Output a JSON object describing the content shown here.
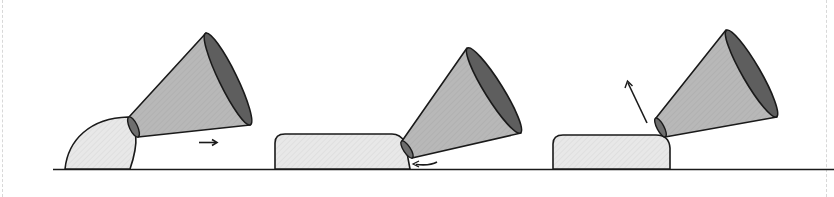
{
  "diagram": {
    "colors": {
      "stroke": "#1a1a1a",
      "cone_body": "#b4b4b4",
      "cone_mouth": "#5e5e5e",
      "cone_throat": "#6e6e6e",
      "shape_fill": "#e6e6e6",
      "background": "#ffffff",
      "border": "#d8d8d8"
    },
    "panels": [
      {
        "id": "panel-1",
        "shape": "quarter-dome",
        "arrow": {
          "direction": "right",
          "glyph": "→"
        }
      },
      {
        "id": "panel-2",
        "shape": "flat-slab",
        "arrow": {
          "direction": "curved-left-along-ground"
        }
      },
      {
        "id": "panel-3",
        "shape": "flat-slab",
        "arrow": {
          "direction": "up-left"
        }
      }
    ]
  }
}
